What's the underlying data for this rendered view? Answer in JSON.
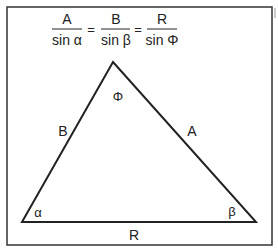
{
  "formula": {
    "terms": [
      {
        "numerator": "A",
        "denominator": "sin α"
      },
      {
        "numerator": "B",
        "denominator": "sin β"
      },
      {
        "numerator": "R",
        "denominator": "sin Φ"
      }
    ],
    "equals": "="
  },
  "triangle": {
    "sides": {
      "left": "B",
      "right": "A",
      "base": "R"
    },
    "angles": {
      "left": "α",
      "right": "β",
      "top": "Φ"
    }
  }
}
